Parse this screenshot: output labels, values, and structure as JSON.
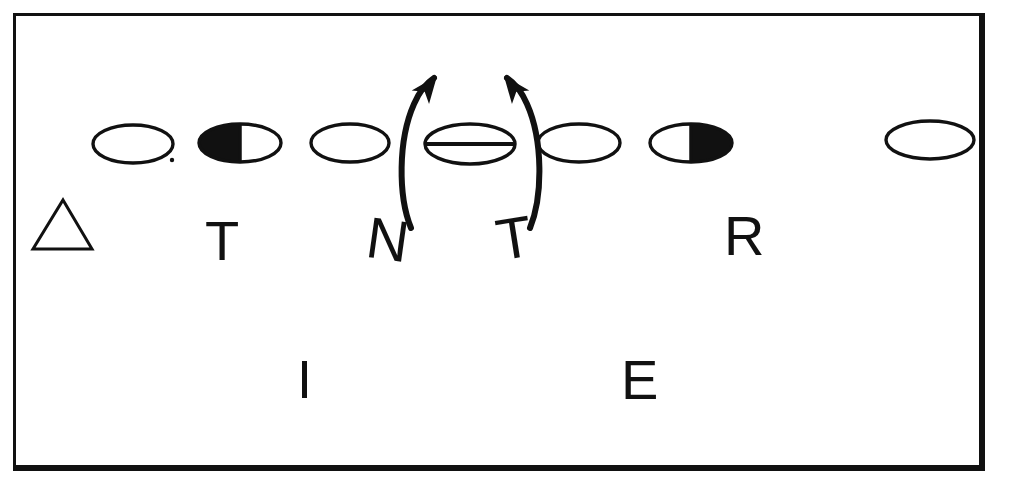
{
  "figure": {
    "kind": "hand-drawn-diagram",
    "background_color": "#ffffff",
    "ink_color": "#111111",
    "width": 1009,
    "height": 486
  },
  "frame": {
    "name": "outer-border-rectangle",
    "x": 13,
    "y": 13,
    "width": 972,
    "height": 458,
    "stroke_color": "#111111",
    "stroke_top": 3,
    "stroke_left": 3,
    "stroke_right": 6,
    "stroke_bottom": 6
  },
  "ellipse_row": {
    "label": "row-of-seven-ellipses",
    "center_y": 143,
    "items": [
      {
        "id": "ellipse-1",
        "cx": 133,
        "cy": 144,
        "rx": 40,
        "ry": 19,
        "fill": "none",
        "note": "empty outline"
      },
      {
        "id": "ellipse-2",
        "cx": 240,
        "cy": 143,
        "rx": 41,
        "ry": 19,
        "fill": "left-half",
        "note": "left half solid black"
      },
      {
        "id": "ellipse-3",
        "cx": 350,
        "cy": 143,
        "rx": 39,
        "ry": 19,
        "fill": "none",
        "note": "empty outline"
      },
      {
        "id": "ellipse-4",
        "cx": 470,
        "cy": 144,
        "rx": 45,
        "ry": 20,
        "fill": "none",
        "note": "horizontal line through middle",
        "has_midline": true
      },
      {
        "id": "ellipse-5",
        "cx": 579,
        "cy": 143,
        "rx": 41,
        "ry": 19,
        "fill": "none",
        "note": "empty outline"
      },
      {
        "id": "ellipse-6",
        "cx": 691,
        "cy": 143,
        "rx": 41,
        "ry": 19,
        "fill": "right-half",
        "note": "right half solid black"
      },
      {
        "id": "ellipse-7",
        "cx": 930,
        "cy": 140,
        "rx": 44,
        "ry": 19,
        "fill": "none",
        "note": "empty outline, far right"
      }
    ]
  },
  "arrows": [
    {
      "id": "left-curved-arrow",
      "description": "arc curving from lower-left upward, arrowhead at top pointing up-right",
      "path": "M 411 228 C 398 196 398 140 414 104 C 420 90 428 82 434 78",
      "head_at": [
        437,
        76
      ],
      "head_angle_deg": -52,
      "stroke": 6
    },
    {
      "id": "right-curved-arrow",
      "description": "arc curving from lower-right upward, arrowhead at top pointing up-left",
      "path": "M 530 228 C 543 196 543 140 527 104 C 521 90 513 82 507 78",
      "head_at": [
        504,
        76
      ],
      "head_angle_deg": 232,
      "stroke": 6
    }
  ],
  "triangle": {
    "id": "triangle-outline",
    "apex": [
      63,
      200
    ],
    "left": [
      33,
      249
    ],
    "right": [
      92,
      249
    ],
    "stroke": 3,
    "fill": "none"
  },
  "glyphs": [
    {
      "id": "glyph-T-1",
      "char": "T",
      "x": 205,
      "y": 213,
      "size": 56,
      "rotation": 0,
      "weight": 400
    },
    {
      "id": "glyph-N",
      "char": "N",
      "x": 371,
      "y": 208,
      "size": 58,
      "rotation": 8,
      "weight": 400
    },
    {
      "id": "glyph-T-2",
      "char": "T",
      "x": 492,
      "y": 212,
      "size": 58,
      "rotation": -9,
      "weight": 400
    },
    {
      "id": "glyph-R",
      "char": "R",
      "x": 724,
      "y": 208,
      "size": 56,
      "rotation": 0,
      "weight": 400
    },
    {
      "id": "glyph-I",
      "char": "I",
      "x": 297,
      "y": 352,
      "size": 54,
      "rotation": 0,
      "weight": 400
    },
    {
      "id": "glyph-E",
      "char": "E",
      "x": 621,
      "y": 352,
      "size": 56,
      "rotation": 0,
      "weight": 400
    }
  ],
  "speck": {
    "id": "ink-speck",
    "cx": 172,
    "cy": 160,
    "r": 2.2
  },
  "reading": {
    "top_row_text": "T N T R",
    "bottom_row_text": "I E"
  }
}
